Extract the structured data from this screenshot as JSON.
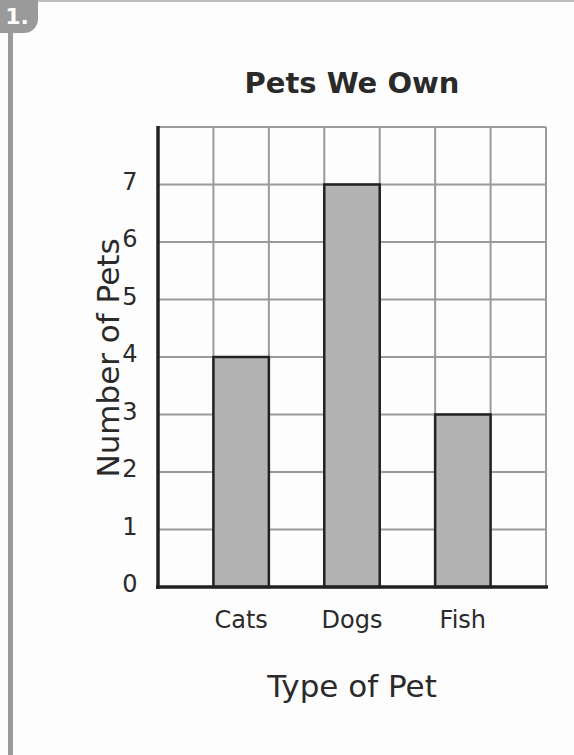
{
  "problem": {
    "number": "1."
  },
  "chart_data": {
    "type": "bar",
    "title": "Pets We Own",
    "xlabel": "Type of Pet",
    "ylabel": "Number of Pets",
    "categories": [
      "Cats",
      "Dogs",
      "Fish"
    ],
    "values": [
      4,
      7,
      3
    ],
    "yticks": [
      "0",
      "1",
      "2",
      "3",
      "4",
      "5",
      "6",
      "7"
    ],
    "ylim": [
      0,
      8
    ],
    "grid": true,
    "legend": "none",
    "bar_color": "#b3b3b3",
    "grid_color": "#9a9a9a",
    "axis_color": "#222222"
  }
}
